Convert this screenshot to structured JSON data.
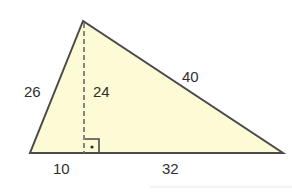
{
  "diagram": {
    "type": "triangle-with-altitude",
    "colors": {
      "fill": "#fdfbd6",
      "stroke": "#4a4a4a",
      "altitude": "#6a6a6a",
      "text": "#2f2f2f"
    },
    "labels": {
      "left_side": "26",
      "altitude": "24",
      "right_side": "40",
      "base_left_segment": "10",
      "base_right_segment": "32"
    },
    "right_angle_marker": "right-angle-with-dot"
  }
}
